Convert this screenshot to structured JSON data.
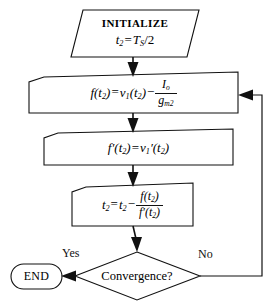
{
  "diagram": {
    "type": "flowchart",
    "colors": {
      "stroke": "#111111",
      "background": "#ffffff"
    },
    "nodes": [
      {
        "id": "initialize",
        "shape": "parallelogram",
        "role": "input",
        "line1": "INITIALIZE",
        "line2_var": "t",
        "line2_sub": "2",
        "line2_eq": "=",
        "line2_rhs_main": "T",
        "line2_rhs_sub": "S",
        "line2_rhs_tail": "/2",
        "text_plain": "INITIALIZE  t2 = TS/2"
      },
      {
        "id": "compute-f",
        "shape": "process",
        "role": "process",
        "lhs": "f(t",
        "lhs_sub": "2",
        "lhs_tail": ")",
        "eq": "=",
        "rhs_v": "v",
        "rhs_v_sub": "1",
        "rhs_v_tail": "(t",
        "rhs_v_sub2": "2",
        "rhs_v_tail2": ")",
        "minus": "−",
        "frac_num": "I",
        "frac_num_sub": "o",
        "frac_den": "g",
        "frac_den_sub": "m2",
        "text_plain": "f(t2) = v1(t2) - Io/gm2"
      },
      {
        "id": "compute-fprime",
        "shape": "process",
        "role": "process",
        "lhs": "f",
        "lhs_prime": "′",
        "lhs_open": "(t",
        "lhs_sub": "2",
        "lhs_close": ")",
        "eq": "=",
        "rhs": "v",
        "rhs_sub": "1",
        "rhs_prime": "′",
        "rhs_open": "(t",
        "rhs_sub2": "2",
        "rhs_close": ")",
        "text_plain": "f'(t2) = v1'(t2)"
      },
      {
        "id": "update-t2",
        "shape": "process",
        "role": "process",
        "lhs": "t",
        "lhs_sub": "2",
        "eq": "=",
        "rhs": "t",
        "rhs_sub": "2",
        "minus": "−",
        "frac_num": "f(t",
        "frac_num_sub": "2",
        "frac_num_tail": ")",
        "frac_den": "f",
        "frac_den_prime": "′",
        "frac_den_open": "(t",
        "frac_den_sub": "2",
        "frac_den_close": ")",
        "text_plain": "t2 = t2 - f(t2)/f'(t2)"
      },
      {
        "id": "convergence-decision",
        "shape": "diamond",
        "role": "decision",
        "label": "Convergence?",
        "text_plain": "Convergence?"
      },
      {
        "id": "end-terminator",
        "shape": "stadium",
        "role": "terminator",
        "label": "END",
        "text_plain": "END"
      }
    ],
    "edges": [
      {
        "id": "e-init-to-f",
        "from": "initialize",
        "to": "compute-f",
        "label": ""
      },
      {
        "id": "e-f-to-fprime",
        "from": "compute-f",
        "to": "compute-fprime",
        "label": ""
      },
      {
        "id": "e-fprime-to-update",
        "from": "compute-fprime",
        "to": "update-t2",
        "label": ""
      },
      {
        "id": "e-update-to-decision",
        "from": "update-t2",
        "to": "convergence-decision",
        "label": ""
      },
      {
        "id": "e-decision-yes-end",
        "from": "convergence-decision",
        "to": "end-terminator",
        "label": "Yes"
      },
      {
        "id": "e-decision-no-loop",
        "from": "convergence-decision",
        "to": "compute-f",
        "label": "No"
      }
    ],
    "branch_labels": {
      "yes": "Yes",
      "no": "No"
    }
  }
}
